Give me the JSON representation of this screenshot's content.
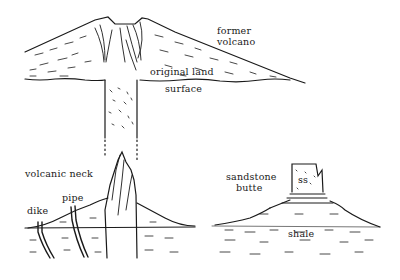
{
  "diagram": {
    "top_panel": {
      "labels": {
        "former_volcano_line1": "former",
        "former_volcano_line2": "volcano",
        "land_surface_line1": "original land",
        "land_surface_line2": "surface"
      }
    },
    "bottom_left_panel": {
      "labels": {
        "volcanic_neck": "volcanic neck",
        "pipe": "pipe",
        "dike": "dike"
      }
    },
    "bottom_right_panel": {
      "labels": {
        "butte_line1": "sandstone",
        "butte_line2": "butte",
        "ss": "ss",
        "shale": "shale"
      }
    },
    "ink_color": "#1a1a1a",
    "background_color": "#ffffff"
  }
}
